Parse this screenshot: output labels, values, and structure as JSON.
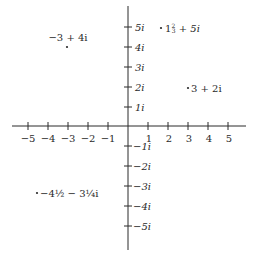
{
  "diagram": {
    "type": "complex-plane",
    "axis_color": "#2a2a2a",
    "text_color": "#2a2a2a",
    "real_axis": {
      "ticks": [
        {
          "value": -5,
          "label": "−5"
        },
        {
          "value": -4,
          "label": "−4"
        },
        {
          "value": -3,
          "label": "−3"
        },
        {
          "value": -2,
          "label": "−2"
        },
        {
          "value": -1,
          "label": "−1"
        },
        {
          "value": 1,
          "label": "1"
        },
        {
          "value": 2,
          "label": "2"
        },
        {
          "value": 3,
          "label": "3"
        },
        {
          "value": 4,
          "label": "4"
        },
        {
          "value": 5,
          "label": "5"
        }
      ]
    },
    "imaginary_axis": {
      "ticks": [
        {
          "value": 5,
          "label": "5i"
        },
        {
          "value": 4,
          "label": "4i"
        },
        {
          "value": 3,
          "label": "3i"
        },
        {
          "value": 2,
          "label": "2i"
        },
        {
          "value": 1,
          "label": "1i"
        },
        {
          "value": -1,
          "label": "−1i"
        },
        {
          "value": -2,
          "label": "−2i"
        },
        {
          "value": -3,
          "label": "−3i"
        },
        {
          "value": -4,
          "label": "−4i"
        },
        {
          "value": -5,
          "label": "−5i"
        }
      ]
    },
    "points": [
      {
        "re": -3,
        "im": 4,
        "label": "−3 + 4i"
      },
      {
        "re": 1.6667,
        "im": 5,
        "label_whole": "1",
        "label_frac_num": "2",
        "label_frac_den": "3",
        "label_rest": " + 5i",
        "label": "1⅔ + 5i"
      },
      {
        "re": 3,
        "im": 2,
        "label": "3 + 2i"
      },
      {
        "re": -4.5,
        "im": -3.25,
        "label": "−4½ − 3¼i"
      }
    ]
  }
}
